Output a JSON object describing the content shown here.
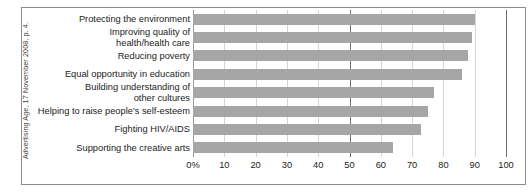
{
  "source_note": "Advertising Age, 17 November 2008, p. 4.",
  "chart_data": {
    "type": "bar",
    "orientation": "horizontal",
    "title": "",
    "subtitle": "",
    "xlabel": "",
    "ylabel": "",
    "categories": [
      "Protecting the environment",
      "Improving quality of\nhealth/health care",
      "Reducing poverty",
      "Equal opportunity in education",
      "Building understanding of\nother cultures",
      "Helping to raise people's self-esteem",
      "Fighting HIV/AIDS",
      "Supporting the creative arts"
    ],
    "values": [
      90,
      89,
      88,
      86,
      77,
      75,
      73,
      64
    ],
    "xlim": [
      0,
      100
    ],
    "xticks": [
      0,
      10,
      20,
      30,
      40,
      50,
      60,
      70,
      80,
      90,
      100
    ],
    "xtick_labels": [
      "0%",
      "10",
      "20",
      "30",
      "40",
      "50",
      "60",
      "70",
      "80",
      "90",
      "100"
    ],
    "grid": true,
    "gridline_emphasis": [
      50,
      100
    ],
    "legend": "none",
    "bar_color": "#a6a6a6",
    "gridline_color": "#d6d6d6",
    "emphasis_gridline_color": "#6e6e6e",
    "frame_color": "#8d8d8d",
    "background_color": "#ffffff",
    "text_color": "#1c1c1c"
  }
}
